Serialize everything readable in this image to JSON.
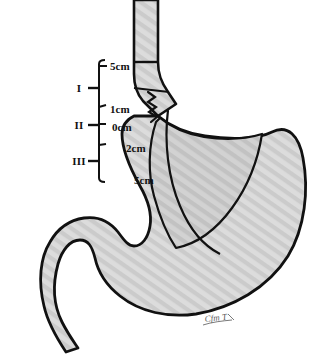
{
  "figure": {
    "background_color": "#ffffff",
    "outline_color": "#111111",
    "organ_fill_color": "#d4d4d4",
    "cardia_fill_color": "#c9c9c9",
    "hatch_color": "#cfcfcf"
  },
  "scale": {
    "name": "measurement-ruler",
    "zones": [
      {
        "id": "I",
        "label": "I"
      },
      {
        "id": "II",
        "label": "II"
      },
      {
        "id": "III",
        "label": "III"
      }
    ]
  },
  "distance_labels": [
    {
      "id": "d-5cm-upper",
      "text": "5cm"
    },
    {
      "id": "d-1cm",
      "text": "1cm"
    },
    {
      "id": "d-0cm",
      "text": "0cm"
    },
    {
      "id": "d-2cm",
      "text": "2cm"
    },
    {
      "id": "d-5cm-lower",
      "text": "5cm"
    }
  ],
  "anatomy": {
    "esophagus": "esophagus",
    "z_line": "z-line",
    "cardia": "cardia",
    "fundus": "fundus",
    "body": "stomach-body",
    "antrum": "antrum",
    "pylorus": "pylorus",
    "duodenum": "duodenum",
    "incisura": "incisura"
  },
  "signature": {
    "text": "Cfm T"
  }
}
